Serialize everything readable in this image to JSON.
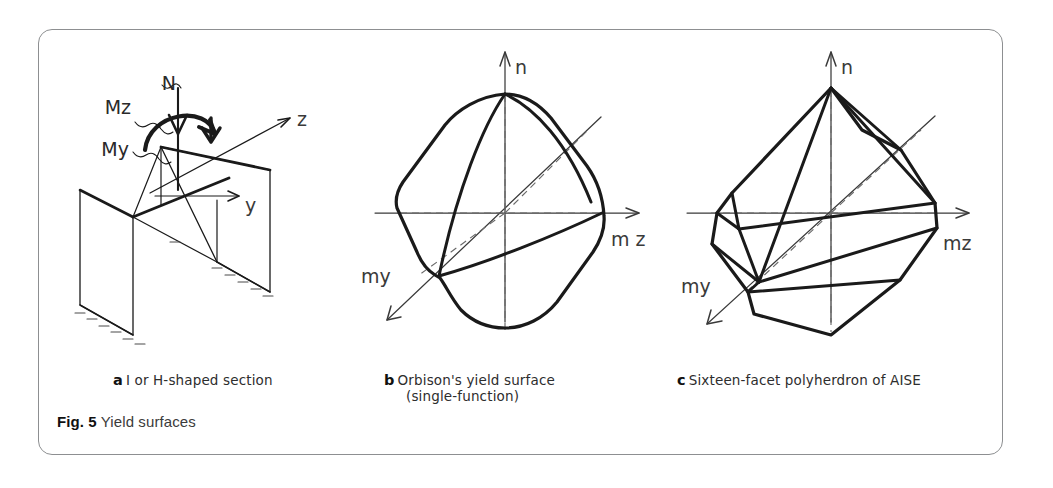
{
  "figure": {
    "number": "Fig. 5",
    "caption": "Yield surfaces"
  },
  "panels": [
    {
      "letter": "a",
      "caption": "I or H-shaped section",
      "kind": "isometric-section-sketch",
      "load_labels": [
        "N",
        "Mz",
        "My"
      ],
      "axis_labels": [
        "z",
        "y"
      ]
    },
    {
      "letter": "b",
      "caption_line1": "Orbison's yield surface",
      "caption_line2": "(single-function)",
      "kind": "smooth-yield-surface",
      "axis_labels": {
        "vertical": "n",
        "right": "m z",
        "diagonal": "my"
      }
    },
    {
      "letter": "c",
      "caption": "Sixteen-facet polyherdron of AISE",
      "kind": "faceted-polyhedron",
      "axis_labels": {
        "vertical": "n",
        "right": "mz",
        "diagonal": "my"
      }
    }
  ],
  "colors": {
    "frame": "#8d8f91",
    "ink": "#1a1a1a",
    "axis": "#3a3a3a",
    "text": "#2d2d2d",
    "background": "#ffffff"
  }
}
